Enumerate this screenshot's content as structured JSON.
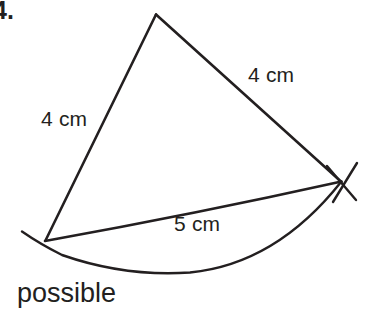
{
  "page": {
    "width": 368,
    "height": 325,
    "background_color": "#ffffff",
    "ink_color": "#231f20"
  },
  "item_number": "4.",
  "answer_text": "possible",
  "figure": {
    "type": "triangle-construction",
    "vertices": {
      "apex": {
        "x": 156,
        "y": 14
      },
      "bottom_left": {
        "x": 45,
        "y": 240
      },
      "right": {
        "x": 341,
        "y": 182
      }
    },
    "sides": [
      {
        "name": "left-side",
        "label": "4 cm",
        "from": "bottom_left",
        "to": "apex"
      },
      {
        "name": "right-side",
        "label": "4 cm",
        "from": "apex",
        "to": "right"
      },
      {
        "name": "base",
        "label": "5 cm",
        "from": "bottom_left",
        "to": "right"
      }
    ],
    "arc": {
      "name": "compass-arc",
      "center": "bottom_left",
      "lowest_point": {
        "x": 190,
        "y": 272
      },
      "start": {
        "x": 22,
        "y": 232
      },
      "end": {
        "x": 341,
        "y": 182
      }
    },
    "construction_marks": {
      "name": "arc-intersection-cross",
      "at": "right",
      "stroke_count": 2
    }
  },
  "labels": {
    "side_left": "4 cm",
    "side_right": "4 cm",
    "base": "5 cm"
  }
}
